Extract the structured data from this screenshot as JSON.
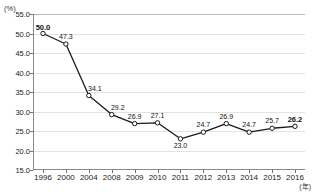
{
  "chart_data": {
    "type": "line",
    "title": "",
    "xlabel": "(年)",
    "ylabel": "(%)",
    "categories": [
      "1996",
      "2000",
      "2004",
      "2008",
      "2009",
      "2010",
      "2011",
      "2012",
      "2013",
      "2014",
      "2015",
      "2016"
    ],
    "values": [
      50.0,
      47.3,
      34.1,
      29.2,
      26.9,
      27.1,
      23.0,
      24.7,
      26.9,
      24.7,
      25.7,
      26.2
    ],
    "point_labels": [
      "50.0",
      "47.3",
      "34.1",
      "29.2",
      "26.9",
      "27.1",
      "23.0",
      "24.7",
      "26.9",
      "24.7",
      "25.7",
      "26.2"
    ],
    "emphasized_points": [
      0,
      11
    ],
    "ylim": [
      15.0,
      55.0
    ],
    "ytick_values": [
      55.0,
      50.0,
      45.0,
      40.0,
      35.0,
      30.0,
      25.0,
      20.0,
      15.0
    ],
    "ytick_labels": [
      "55.0",
      "50.0",
      "45.0",
      "40.0",
      "35.0",
      "30.0",
      "25.0",
      "20.0",
      "15.0"
    ],
    "grid": true,
    "legend": false,
    "marker": "open-circle",
    "line_color": "#1a1a1a",
    "marker_fill": "#ffffff"
  },
  "axes": {
    "y_unit_label": "(%)",
    "x_unit_label": "(年)"
  }
}
